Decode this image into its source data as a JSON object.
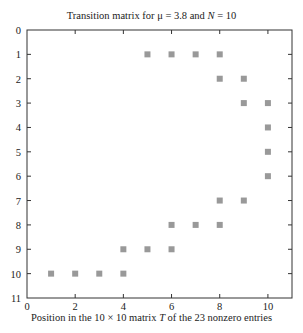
{
  "chart_data": {
    "type": "scatter",
    "title": "Transition matrix for μ = 3.8 and N = 10",
    "xlabel": "Position in the 10 × 10 matrix T of the 23 nonzero entries",
    "ylabel": "",
    "xlim": [
      0,
      11
    ],
    "ylim": [
      11,
      0
    ],
    "y_inverted": true,
    "xticks": [
      0,
      2,
      4,
      6,
      8,
      10
    ],
    "yticks": [
      0,
      1,
      2,
      3,
      4,
      5,
      6,
      7,
      8,
      9,
      10,
      11
    ],
    "grid": false,
    "legend": null,
    "marker": "square",
    "marker_color": "#999999",
    "points": [
      {
        "col": 5,
        "row": 1
      },
      {
        "col": 6,
        "row": 1
      },
      {
        "col": 7,
        "row": 1
      },
      {
        "col": 8,
        "row": 1
      },
      {
        "col": 8,
        "row": 2
      },
      {
        "col": 9,
        "row": 2
      },
      {
        "col": 9,
        "row": 3
      },
      {
        "col": 10,
        "row": 3
      },
      {
        "col": 10,
        "row": 4
      },
      {
        "col": 10,
        "row": 5
      },
      {
        "col": 10,
        "row": 6
      },
      {
        "col": 8,
        "row": 7
      },
      {
        "col": 9,
        "row": 7
      },
      {
        "col": 6,
        "row": 8
      },
      {
        "col": 7,
        "row": 8
      },
      {
        "col": 8,
        "row": 8
      },
      {
        "col": 4,
        "row": 9
      },
      {
        "col": 5,
        "row": 9
      },
      {
        "col": 6,
        "row": 9
      },
      {
        "col": 1,
        "row": 10
      },
      {
        "col": 2,
        "row": 10
      },
      {
        "col": 3,
        "row": 10
      },
      {
        "col": 4,
        "row": 10
      }
    ],
    "nonzero_count": 23
  },
  "labels": {
    "title": "Transition matrix for μ = 3.8 and N = 10",
    "xlabel": "Position in the 10 × 10 matrix T of the 23 nonzero entries"
  }
}
